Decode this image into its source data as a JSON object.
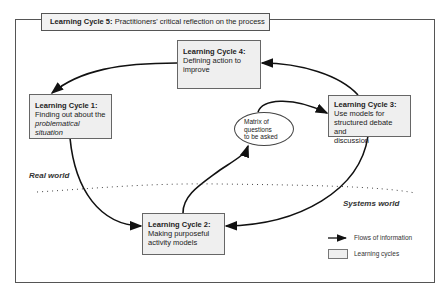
{
  "header": {
    "label_bold": "Learning Cycle 5:",
    "label_text": "Practitioners' critical reflection on the process"
  },
  "cycles": [
    {
      "id": 1,
      "title": "Learning Cycle 1:",
      "line1": "Finding out about the",
      "line2_italic": "problematical situation"
    },
    {
      "id": 2,
      "title": "Learning Cycle 2:",
      "line1": "Making purposeful",
      "line2": "activity models"
    },
    {
      "id": 3,
      "title": "Learning Cycle 3:",
      "line1": "Use models for",
      "line2": "structured debate and",
      "line3": "discussion"
    },
    {
      "id": 4,
      "title": "Learning Cycle 4:",
      "line1": "Defining action to",
      "line2": "improve"
    }
  ],
  "ellipse": {
    "line1": "Matrix of",
    "line2": "questions",
    "line3": "to be asked"
  },
  "regions": {
    "real_world": "Real world",
    "systems_world": "Systems world"
  },
  "legend": {
    "flows": "Flows of information",
    "cycles": "Learning cycles"
  },
  "colors": {
    "box_fill": "#efefef",
    "line": "#111111",
    "border": "#555555"
  }
}
